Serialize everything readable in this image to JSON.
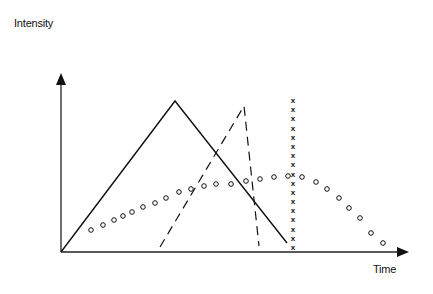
{
  "chart_data": {
    "type": "line",
    "title": "",
    "xlabel": "Time",
    "ylabel": "Intensity",
    "grid": false,
    "legend": "none",
    "axes_origin_px": [
      61,
      252
    ],
    "series": [
      {
        "name": "solid-triangle",
        "style": "solid",
        "points_px": [
          [
            61,
            252
          ],
          [
            175,
            101
          ],
          [
            287,
            243
          ]
        ]
      },
      {
        "name": "dashed-triangle",
        "style": "dashed",
        "points_px": [
          [
            160,
            247
          ],
          [
            244,
            106
          ],
          [
            259,
            246
          ]
        ]
      },
      {
        "name": "x-markers",
        "style": "marker-x",
        "x_px": 293,
        "y_range_px": [
          100,
          247
        ],
        "count": 17
      },
      {
        "name": "circle-markers",
        "style": "marker-o",
        "points_px": [
          [
            91,
            230
          ],
          [
            103,
            225
          ],
          [
            114,
            220
          ],
          [
            123,
            216
          ],
          [
            132,
            212
          ],
          [
            143,
            207
          ],
          [
            155,
            203
          ],
          [
            166,
            198
          ],
          [
            179,
            192
          ],
          [
            191,
            189
          ],
          [
            204,
            186
          ],
          [
            216,
            184
          ],
          [
            231,
            184
          ],
          [
            246,
            181
          ],
          [
            260,
            179
          ],
          [
            274,
            177
          ],
          [
            288,
            176
          ],
          [
            302,
            177
          ],
          [
            316,
            182
          ],
          [
            327,
            189
          ],
          [
            339,
            198
          ],
          [
            349,
            208
          ],
          [
            360,
            218
          ],
          [
            371,
            233
          ],
          [
            383,
            243
          ]
        ]
      }
    ]
  },
  "axes": {
    "y_label": "Intensity",
    "x_label": "Time"
  },
  "colors": {
    "ink": "#111111",
    "background": "#ffffff"
  }
}
